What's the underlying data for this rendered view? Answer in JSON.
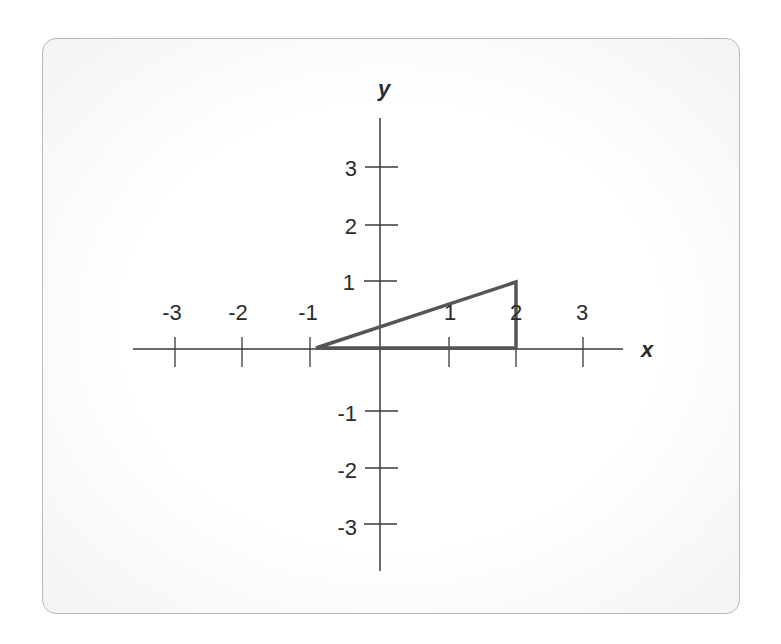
{
  "diagram": {
    "x_axis_label": "x",
    "y_axis_label": "y",
    "x_ticks": [
      "-3",
      "-2",
      "-1",
      "1",
      "2",
      "3"
    ],
    "y_ticks": [
      "3",
      "2",
      "1",
      "-1",
      "-2",
      "-3"
    ],
    "shape": "triangle",
    "vertices": [
      [
        -1,
        0
      ],
      [
        2,
        0
      ],
      [
        2,
        1
      ]
    ],
    "colors": {
      "axis": "#3a3a3a",
      "triangle": "#555555",
      "card_border": "#b9b9b9"
    }
  }
}
